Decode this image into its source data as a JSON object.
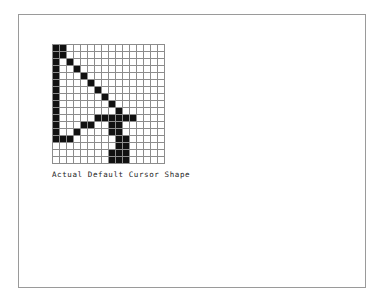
{
  "page": {
    "background_color": "#ffffff",
    "border_color": "#9a9a9a"
  },
  "figure": {
    "caption": "Actual Default Cursor Shape",
    "grid": {
      "columns": 16,
      "rows": 17,
      "cell_on_color": "#111111",
      "cell_off_color": "#ffffff",
      "gridline_color": "#8c8c8c",
      "legend": {
        "on": "cursor pixel (black)",
        "off": "empty pixel (white)"
      },
      "pixels": [
        [
          1,
          1,
          0,
          0,
          0,
          0,
          0,
          0,
          0,
          0,
          0,
          0,
          0,
          0,
          0,
          0
        ],
        [
          1,
          1,
          0,
          0,
          0,
          0,
          0,
          0,
          0,
          0,
          0,
          0,
          0,
          0,
          0,
          0
        ],
        [
          1,
          0,
          1,
          0,
          0,
          0,
          0,
          0,
          0,
          0,
          0,
          0,
          0,
          0,
          0,
          0
        ],
        [
          1,
          0,
          0,
          1,
          0,
          0,
          0,
          0,
          0,
          0,
          0,
          0,
          0,
          0,
          0,
          0
        ],
        [
          1,
          0,
          0,
          0,
          1,
          0,
          0,
          0,
          0,
          0,
          0,
          0,
          0,
          0,
          0,
          0
        ],
        [
          1,
          0,
          0,
          0,
          0,
          1,
          0,
          0,
          0,
          0,
          0,
          0,
          0,
          0,
          0,
          0
        ],
        [
          1,
          0,
          0,
          0,
          0,
          0,
          1,
          0,
          0,
          0,
          0,
          0,
          0,
          0,
          0,
          0
        ],
        [
          1,
          0,
          0,
          0,
          0,
          0,
          0,
          1,
          0,
          0,
          0,
          0,
          0,
          0,
          0,
          0
        ],
        [
          1,
          0,
          0,
          0,
          0,
          0,
          0,
          0,
          1,
          0,
          0,
          0,
          0,
          0,
          0,
          0
        ],
        [
          1,
          0,
          0,
          0,
          0,
          0,
          0,
          0,
          0,
          1,
          0,
          0,
          0,
          0,
          0,
          0
        ],
        [
          1,
          0,
          0,
          0,
          0,
          0,
          1,
          1,
          1,
          1,
          1,
          1,
          0,
          0,
          0,
          0
        ],
        [
          1,
          0,
          0,
          0,
          1,
          1,
          0,
          0,
          1,
          1,
          0,
          0,
          0,
          0,
          0,
          0
        ],
        [
          1,
          0,
          0,
          1,
          0,
          0,
          0,
          0,
          1,
          1,
          0,
          0,
          0,
          0,
          0,
          0
        ],
        [
          1,
          1,
          1,
          0,
          0,
          0,
          0,
          0,
          0,
          1,
          1,
          0,
          0,
          0,
          0,
          0
        ],
        [
          0,
          0,
          0,
          0,
          0,
          0,
          0,
          0,
          0,
          1,
          1,
          0,
          0,
          0,
          0,
          0
        ],
        [
          0,
          0,
          0,
          0,
          0,
          0,
          0,
          0,
          1,
          1,
          1,
          0,
          0,
          0,
          0,
          0
        ],
        [
          0,
          0,
          0,
          0,
          0,
          0,
          0,
          0,
          1,
          1,
          1,
          0,
          0,
          0,
          0,
          0
        ]
      ]
    }
  }
}
